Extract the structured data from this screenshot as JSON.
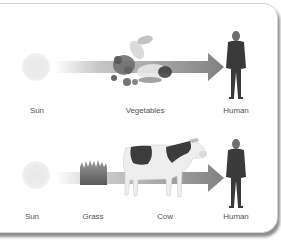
{
  "diagram": {
    "colors": {
      "arrow": "#8a8a8a",
      "arrow_fade": "#ffffff",
      "label": "#555555",
      "panel_border": "#d4d4d4",
      "figure": "#3a3a3a"
    },
    "chains": [
      {
        "nodes": [
          {
            "label": "Sun",
            "icon": "sun-icon"
          },
          {
            "label": "Vegetables",
            "icon": "vegetables-icon"
          },
          {
            "label": "Human",
            "icon": "human-figure-icon"
          }
        ]
      },
      {
        "nodes": [
          {
            "label": "Sun",
            "icon": "sun-icon"
          },
          {
            "label": "Grass",
            "icon": "grass-icon"
          },
          {
            "label": "Cow",
            "icon": "cow-icon"
          },
          {
            "label": "Human",
            "icon": "human-figure-icon"
          }
        ]
      }
    ]
  }
}
